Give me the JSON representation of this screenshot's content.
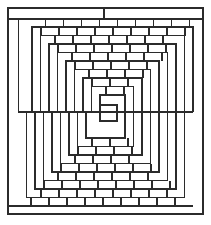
{
  "figure": {
    "kind": "brick-pattern-maze",
    "stroke_color": "#2b2b2b",
    "background": "#ffffff",
    "outer_frame": {
      "x1": 8,
      "y1": 8,
      "x2": 203,
      "y2": 214
    },
    "top_bar_y": 19,
    "top_tick_x": 104,
    "bottom_bar_y": 206,
    "split_y": 112,
    "split_x1": 18,
    "split_x2": 193,
    "top_levels": 9,
    "bottom_levels": 9,
    "level_step": 8.5,
    "top_first": {
      "x1": 32,
      "y1": 27,
      "x2": 193
    },
    "bottom_first": {
      "x1": 18,
      "x2": 193,
      "y2": 206
    },
    "center_square": {
      "x1": 100,
      "y1": 105,
      "x2": 117,
      "y2": 121
    },
    "brick_width": 18
  }
}
